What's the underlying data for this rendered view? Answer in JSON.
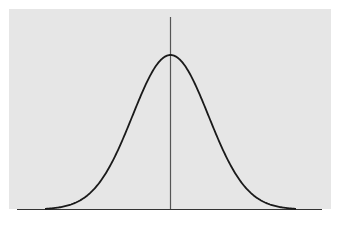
{
  "figure": {
    "background_color": "#e6e6e6",
    "curve_color": "#1a1a1a",
    "axis_color": "#333333",
    "mean_line_color": "#555555"
  }
}
